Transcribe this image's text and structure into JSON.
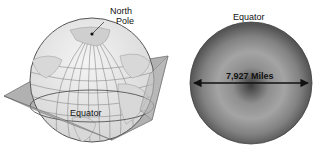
{
  "globe": {
    "north_pole_label_line1": "North",
    "north_pole_label_line2": "Pole",
    "equator_label": "Equator"
  },
  "cross_section": {
    "equator_label": "Equator",
    "diameter_label": "7,927 Miles"
  },
  "colors": {
    "globe_fill": "#ececec",
    "grid": "#8a8a8a",
    "plane_fill": "#a9a9a9",
    "disk_edge": "#4a4a4a",
    "disk_center": "#3c3c3c",
    "disk_ring": "#9a9a9a",
    "arrow": "#111111"
  }
}
